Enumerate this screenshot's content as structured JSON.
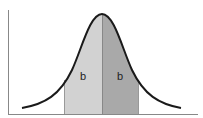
{
  "diagram": {
    "type": "normal-distribution",
    "curve": {
      "stroke_color": "#1a1a1a",
      "peak_x": 102,
      "peak_y": 14,
      "baseline_y": 114
    },
    "regions": [
      {
        "name": "left-band",
        "label": "b",
        "x_start": 64,
        "x_end": 102,
        "fill": "#d2d2d2"
      },
      {
        "name": "right-band",
        "label": "b",
        "x_start": 102,
        "x_end": 139,
        "fill": "#a9a9a9"
      }
    ],
    "axes": {
      "color": "#888888",
      "x_axis_label": "",
      "y_axis_label": ""
    }
  }
}
